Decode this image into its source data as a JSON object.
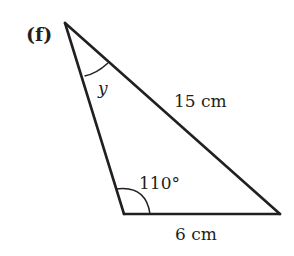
{
  "diagram": {
    "part_label": "(f)",
    "type": "triangle",
    "vertices": {
      "top": [
        65,
        23
      ],
      "bottom_left": [
        124,
        214
      ],
      "bottom_right": [
        280,
        214
      ]
    },
    "labels": {
      "angle_top": "y",
      "angle_bottom_left": "110°",
      "side_hypotenuse": "15 cm",
      "side_base": "6 cm"
    },
    "colors": {
      "stroke": "#231f20",
      "text": "#231f20",
      "background": "#ffffff"
    }
  }
}
